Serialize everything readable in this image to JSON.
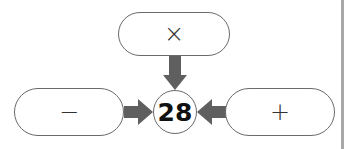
{
  "diagram": {
    "center_value": "28",
    "operators": {
      "top": "×",
      "left": "−",
      "right": "+"
    },
    "colors": {
      "arrow": "#5f5f5f",
      "border": "#6a6a6a",
      "divider": "#a8a8a8"
    }
  }
}
